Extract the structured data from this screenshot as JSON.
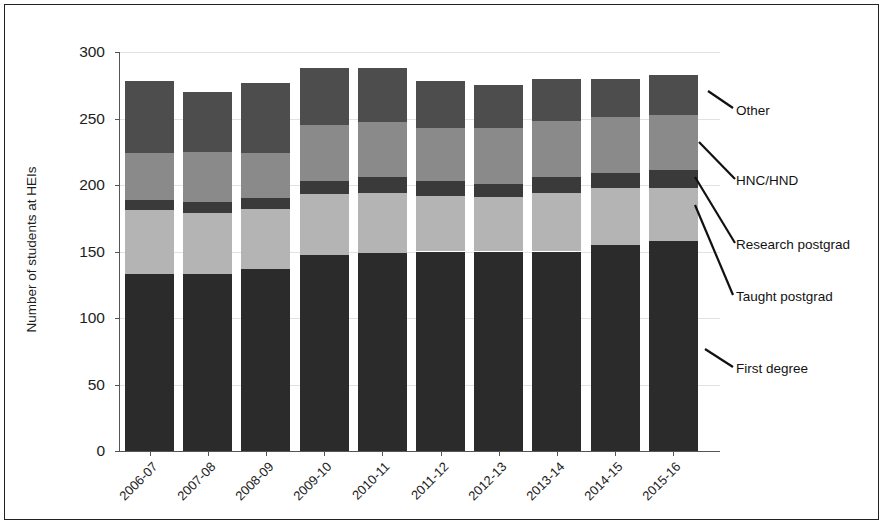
{
  "chart_data": {
    "type": "bar",
    "stacked": true,
    "title": "",
    "xlabel": "",
    "ylabel": "Number of students at HEIs",
    "ylim": [
      0,
      300
    ],
    "yticks": [
      0,
      50,
      100,
      150,
      200,
      250,
      300
    ],
    "grid": true,
    "legend_position": "right-callouts",
    "categories": [
      "2006-07",
      "2007-08",
      "2008-09",
      "2009-10",
      "2010-11",
      "2011-12",
      "2012-13",
      "2013-14",
      "2014-15",
      "2015-16"
    ],
    "series": [
      {
        "name": "First degree",
        "color": "#2b2b2b",
        "values": [
          133,
          133,
          137,
          147,
          149,
          150,
          150,
          150,
          155,
          158
        ]
      },
      {
        "name": "Taught postgrad",
        "color": "#b4b4b4",
        "values": [
          48,
          46,
          45,
          46,
          45,
          42,
          41,
          44,
          43,
          40
        ]
      },
      {
        "name": "Research postgrad",
        "color": "#3a3a3a",
        "values": [
          8,
          8,
          8,
          10,
          12,
          11,
          10,
          12,
          11,
          13
        ]
      },
      {
        "name": "HNC/HND",
        "color": "#8a8a8a",
        "values": [
          35,
          38,
          34,
          42,
          41,
          40,
          42,
          42,
          42,
          42
        ]
      },
      {
        "name": "Other",
        "color": "#4d4d4d",
        "values": [
          54,
          45,
          53,
          43,
          41,
          35,
          32,
          32,
          29,
          30
        ]
      }
    ],
    "totals": [
      278,
      270,
      277,
      288,
      288,
      278,
      275,
      280,
      280,
      283
    ]
  },
  "legend": {
    "items": [
      {
        "label": "Other"
      },
      {
        "label": "HNC/HND"
      },
      {
        "label": "Research postgrad"
      },
      {
        "label": "Taught postgrad"
      },
      {
        "label": "First degree"
      }
    ]
  },
  "axis": {
    "y_title": "Number of students at HEIs"
  }
}
